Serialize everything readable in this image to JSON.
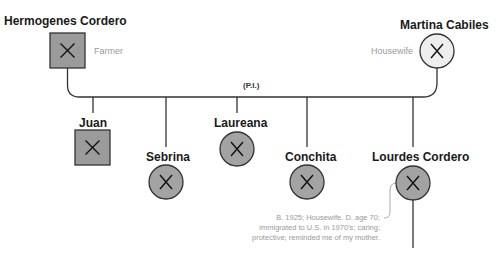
{
  "diagram_type": "genogram",
  "colors": {
    "male_fill": "#9b9b9b",
    "female_fill": "#a3a3a3",
    "martina_fill": "#eeeeee",
    "stroke": "#333333",
    "annotation_text": "#9a9a9a"
  },
  "parents": {
    "father": {
      "name": "Hermogenes Cordero",
      "occupation": "Farmer",
      "symbol": "square",
      "deceased": true
    },
    "mother": {
      "name": "Martina Cabiles",
      "occupation": "Housewife",
      "symbol": "circle",
      "deceased": true
    }
  },
  "marriage": {
    "label": "(P.I.)"
  },
  "children": [
    {
      "name": "Juan",
      "symbol": "square",
      "deceased": true
    },
    {
      "name": "Sebrina",
      "symbol": "circle",
      "deceased": true
    },
    {
      "name": "Laureana",
      "symbol": "circle",
      "deceased": true
    },
    {
      "name": "Conchita",
      "symbol": "circle",
      "deceased": true
    },
    {
      "name": "Lourdes Cordero",
      "symbol": "circle",
      "deceased": true
    }
  ],
  "annotation": {
    "line1": "B. 1925; Housewife. D. age 70;",
    "line2": "immigrated to U.S. in 1970's; caring;",
    "line3": "protective; reminded me of my mother."
  },
  "deceased_mark": "X"
}
